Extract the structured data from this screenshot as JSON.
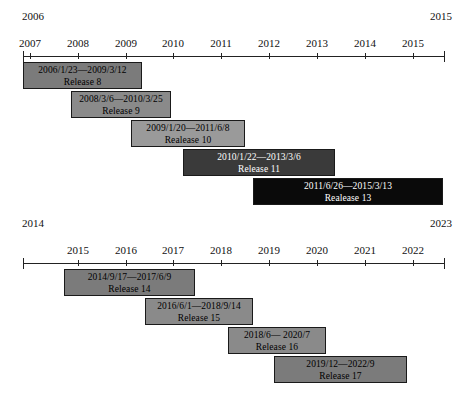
{
  "chart_data": [
    {
      "type": "bar",
      "id": "timeline-2006-2015",
      "title": "",
      "orientation": "horizontal-gantt",
      "xlabel": "",
      "ylabel": "",
      "range_start_label": "2006",
      "range_end_label": "2015",
      "xlim": [
        "2006",
        "2015"
      ],
      "grid": false,
      "legend": "none",
      "tick_labels": [
        "2007",
        "2008",
        "2009",
        "2010",
        "2011",
        "2012",
        "2013",
        "2014",
        "2015"
      ],
      "tick_values": [
        2007,
        2008,
        2009,
        2010,
        2011,
        2012,
        2013,
        2014,
        2015
      ],
      "bars": [
        {
          "name": "Release 8",
          "range_text": "2006/1/23—2009/3/12",
          "label": "Release 8",
          "start": "2006/1/23",
          "end": "2009/3/12",
          "color": "#7b7b7b"
        },
        {
          "name": "Release 9",
          "range_text": "2008/3/6—2010/3/25",
          "label": "Release 9",
          "start": "2008/3/6",
          "end": "2010/3/25",
          "color": "#8a8a8a"
        },
        {
          "name": "Realease 10",
          "range_text": "2009/1/20—2011/6/8",
          "label": "Realease 10",
          "start": "2009/1/20",
          "end": "2011/6/8",
          "color": "#9a9a9a"
        },
        {
          "name": "Release 11",
          "range_text": "2010/1/22—2013/3/6",
          "label": "Release 11",
          "start": "2010/1/22",
          "end": "2013/3/6",
          "color": "#3a3a3a"
        },
        {
          "name": "Realease 13",
          "range_text": "2011/6/26—2015/3/13",
          "label": "Realease 13",
          "start": "2011/6/26",
          "end": "2015/3/13",
          "color": "#0a0a0a"
        }
      ]
    },
    {
      "type": "bar",
      "id": "timeline-2014-2023",
      "title": "",
      "orientation": "horizontal-gantt",
      "xlabel": "",
      "ylabel": "",
      "range_start_label": "2014",
      "range_end_label": "2023",
      "xlim": [
        "2014",
        "2023"
      ],
      "grid": false,
      "legend": "none",
      "tick_labels": [
        "2015",
        "2016",
        "2017",
        "2018",
        "2019",
        "2020",
        "2021",
        "2022"
      ],
      "tick_values": [
        2015,
        2016,
        2017,
        2018,
        2019,
        2020,
        2021,
        2022
      ],
      "bars": [
        {
          "name": "Release 14",
          "range_text": "2014/9/17—2017/6/9",
          "label": "Release 14",
          "start": "2014/9/17",
          "end": "2017/6/9",
          "color": "#7b7b7b"
        },
        {
          "name": "Release 15",
          "range_text": "2016/6/1—2018/9/14",
          "label": "Release 15",
          "start": "2016/6/1",
          "end": "2018/9/14",
          "color": "#8a8a8a"
        },
        {
          "name": "Release 16",
          "range_text": "2018/6— 2020/7",
          "label": "Release 16",
          "start": "2018/6",
          "end": "2020/7",
          "color": "#8a8a8a"
        },
        {
          "name": "Release 17",
          "range_text": "2019/12—2022/9",
          "label": "Release 17",
          "start": "2019/12",
          "end": "2022/9",
          "color": "#7b7b7b"
        }
      ]
    }
  ],
  "layout": {
    "top": {
      "ticks_px": [
        30,
        78,
        126,
        173,
        221,
        269,
        317,
        365,
        413
      ],
      "bars_px": [
        {
          "left": 23,
          "width": 119,
          "top": 62
        },
        {
          "left": 71,
          "width": 100,
          "top": 91
        },
        {
          "left": 131,
          "width": 114,
          "top": 120
        },
        {
          "left": 183,
          "width": 152,
          "top": 149
        },
        {
          "left": 253,
          "width": 190,
          "top": 178
        }
      ]
    },
    "bottom": {
      "ticks_px": [
        78,
        126,
        173,
        221,
        269,
        317,
        365,
        413
      ],
      "bars_px": [
        {
          "left": 64,
          "width": 131,
          "top": 54
        },
        {
          "left": 145,
          "width": 108,
          "top": 83
        },
        {
          "left": 228,
          "width": 98,
          "top": 112
        },
        {
          "left": 274,
          "width": 133,
          "top": 141
        }
      ]
    }
  }
}
